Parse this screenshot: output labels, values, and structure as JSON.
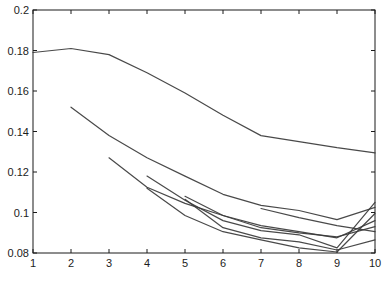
{
  "figure": {
    "colors": {
      "background": "#ffffff",
      "line": "#3a3a3a",
      "axis": "#1a1a1a",
      "text": "#1c1c1c"
    }
  },
  "chart_data": {
    "type": "line",
    "title": "",
    "xlabel": "",
    "ylabel": "",
    "xlim": [
      1,
      10
    ],
    "ylim": [
      0.08,
      0.2
    ],
    "grid": false,
    "legend": null,
    "x_tick_values": [
      1,
      2,
      3,
      4,
      5,
      6,
      7,
      8,
      9,
      10
    ],
    "x_tick_labels": [
      "1",
      "2",
      "3",
      "4",
      "5",
      "6",
      "7",
      "8",
      "9",
      "10"
    ],
    "y_tick_values": [
      0.2,
      0.18,
      0.16,
      0.14,
      0.12,
      0.1,
      0.08
    ],
    "y_tick_labels": [
      "0.2",
      "0.18",
      "0.16",
      "0.14",
      "0.12",
      "0.1",
      "0.08"
    ],
    "series": [
      {
        "name": "curve-1",
        "x": [
          1,
          2,
          3,
          4,
          5,
          6,
          7,
          8,
          9,
          10
        ],
        "y": [
          0.179,
          0.181,
          0.178,
          0.169,
          0.159,
          0.148,
          0.138,
          0.135,
          0.132,
          0.1295
        ]
      },
      {
        "name": "curve-2",
        "x": [
          2,
          3,
          4,
          5,
          6,
          7,
          8,
          9,
          10
        ],
        "y": [
          0.152,
          0.138,
          0.127,
          0.118,
          0.109,
          0.1035,
          0.101,
          0.0965,
          0.1025
        ]
      },
      {
        "name": "curve-3",
        "x": [
          3,
          4,
          5,
          6,
          7,
          8,
          9,
          10
        ],
        "y": [
          0.127,
          0.1125,
          0.1045,
          0.0985,
          0.0925,
          0.09,
          0.088,
          0.093
        ]
      },
      {
        "name": "curve-4",
        "x": [
          4,
          5,
          6,
          7,
          8,
          9,
          10
        ],
        "y": [
          0.118,
          0.106,
          0.096,
          0.091,
          0.089,
          0.0825,
          0.105
        ]
      },
      {
        "name": "curve-5",
        "x": [
          4,
          5,
          6,
          7,
          8,
          9,
          10
        ],
        "y": [
          0.112,
          0.0985,
          0.0905,
          0.0865,
          0.0825,
          0.0805,
          0.0995
        ]
      },
      {
        "name": "curve-6",
        "x": [
          5,
          6,
          7,
          8,
          9,
          10
        ],
        "y": [
          0.1065,
          0.0925,
          0.0875,
          0.0855,
          0.0815,
          0.0865
        ]
      },
      {
        "name": "curve-7",
        "x": [
          5,
          6,
          7,
          8,
          9,
          10
        ],
        "y": [
          0.108,
          0.0985,
          0.0935,
          0.0905,
          0.0875,
          0.096
        ]
      },
      {
        "name": "curve-8",
        "x": [
          7,
          8,
          9,
          10
        ],
        "y": [
          0.102,
          0.0975,
          0.0935,
          0.0905
        ]
      }
    ]
  }
}
